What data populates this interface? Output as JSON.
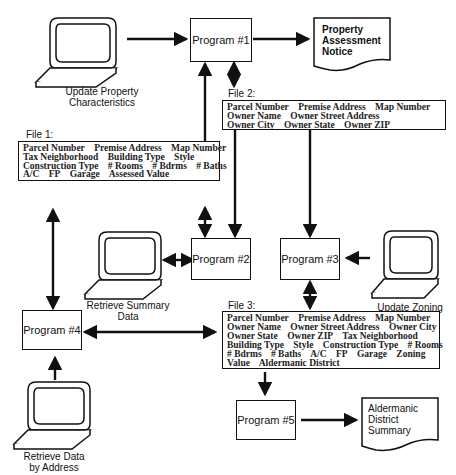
{
  "programs": {
    "p1": "Program #1",
    "p2": "Program #2",
    "p3": "Program #3",
    "p4": "Program #4",
    "p5": "Program #5"
  },
  "terminals": {
    "update_property": [
      "Update Property",
      "Characteristics"
    ],
    "retrieve_summary": [
      "Retrieve Summary",
      "Data"
    ],
    "update_zoning": [
      "Update Zoning",
      "Code"
    ],
    "retrieve_address": [
      "Retrieve Data",
      "by Address"
    ]
  },
  "documents": {
    "assessment_notice": [
      "Property",
      "Assessment",
      "Notice"
    ],
    "aldermanic_summary": [
      "Aldermanic",
      "District",
      "Summary"
    ]
  },
  "files": {
    "file1": {
      "title": "File 1:",
      "lines": [
        [
          "Parcel Number",
          "Premise Address",
          "Map Number"
        ],
        [
          "Tax Neighborhood",
          "Building Type",
          "Style"
        ],
        [
          "Construction Type",
          "# Rooms",
          "# Bdrms",
          "# Baths"
        ],
        [
          "A/C",
          "FP",
          "Garage",
          "Assessed Value"
        ]
      ]
    },
    "file2": {
      "title": "File 2:",
      "lines": [
        [
          "Parcel Number",
          "Premise Address",
          "Map Number"
        ],
        [
          "Owner Name",
          "Owner Street Address"
        ],
        [
          "Owner City",
          "Owner State",
          "Owner ZIP"
        ]
      ]
    },
    "file3": {
      "title": "File 3:",
      "lines": [
        [
          "Parcel Number",
          "Premise Address",
          "Map Number"
        ],
        [
          "Owner Name",
          "Owner Street Address",
          "Owner City"
        ],
        [
          "Owner State",
          "Owner ZIP",
          "Tax Neighborhood"
        ],
        [
          "Building Type",
          "Style",
          "Construction Type",
          "# Rooms"
        ],
        [
          "# Bdrms",
          "# Baths",
          "A/C",
          "FP",
          "Garage",
          "Zoning"
        ],
        [
          "Value",
          "Aldermanic District"
        ]
      ]
    }
  }
}
